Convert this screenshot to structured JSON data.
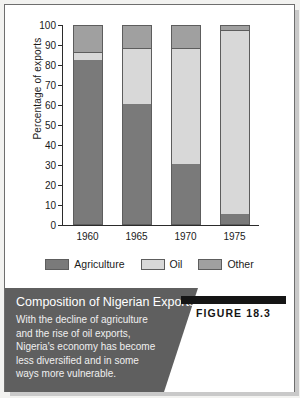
{
  "chart_data": {
    "type": "bar",
    "stacked": true,
    "title": "Composition of Nigerian Exports",
    "xlabel": "",
    "ylabel": "Percentage of exports",
    "ylim": [
      0,
      100
    ],
    "yticks": [
      0,
      10,
      20,
      30,
      40,
      50,
      60,
      70,
      80,
      90,
      100
    ],
    "grid": false,
    "legend_position": "bottom",
    "categories": [
      "1960",
      "1965",
      "1970",
      "1975"
    ],
    "series": [
      {
        "name": "Agriculture",
        "color": "#7a7a7a",
        "values": [
          82,
          60,
          30,
          5
        ]
      },
      {
        "name": "Oil",
        "color": "#d8d8d8",
        "values": [
          4,
          28,
          58,
          92
        ]
      },
      {
        "name": "Other",
        "color": "#a0a0a0",
        "values": [
          14,
          12,
          12,
          3
        ]
      }
    ]
  },
  "caption": {
    "title": "Composition of Nigerian Exports",
    "body_lines": [
      "With the decline of agriculture",
      "and the rise of oil exports,",
      "Nigeria's economy has become",
      "less diversified and in some",
      "ways more vulnerable."
    ],
    "figure_label": "FIGURE 18.3"
  },
  "colors": {
    "agriculture": "#7a7a7a",
    "oil": "#d8d8d8",
    "other": "#a0a0a0",
    "caption_band": "#5f5f5f",
    "axis": "#2b2b2b"
  }
}
